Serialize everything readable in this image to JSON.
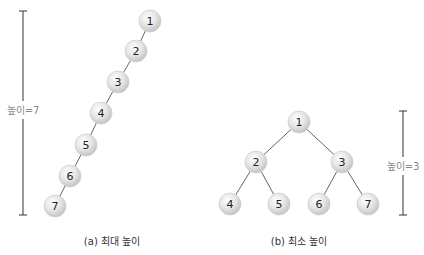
{
  "colors": {
    "node_fill_light": "#f7f7f7",
    "node_fill_dark": "#c9c9c9",
    "node_stroke": "#d0d0d0",
    "edge": "#555555",
    "height_bar": "#333333",
    "height_label": "#8a8a8a"
  },
  "node_radius": 11,
  "trees": [
    {
      "id": "max-height",
      "caption": "(a) 최대 높이",
      "caption_pos": {
        "x": 112,
        "y": 233
      },
      "nodes": [
        {
          "label": "1",
          "x": 150,
          "y": 21
        },
        {
          "label": "2",
          "x": 136,
          "y": 51
        },
        {
          "label": "3",
          "x": 118,
          "y": 82
        },
        {
          "label": "4",
          "x": 101,
          "y": 113
        },
        {
          "label": "5",
          "x": 86,
          "y": 145
        },
        {
          "label": "6",
          "x": 70,
          "y": 176
        },
        {
          "label": "7",
          "x": 55,
          "y": 206
        }
      ],
      "edges": [
        [
          0,
          1
        ],
        [
          1,
          2
        ],
        [
          2,
          3
        ],
        [
          3,
          4
        ],
        [
          4,
          5
        ],
        [
          5,
          6
        ]
      ],
      "height_bar": {
        "x": 23,
        "y1": 11,
        "y2": 215,
        "label": "높이=7",
        "label_y": 110,
        "label_x": 23
      }
    },
    {
      "id": "min-height",
      "caption": "(b) 최소 높이",
      "caption_pos": {
        "x": 299,
        "y": 233
      },
      "nodes": [
        {
          "label": "1",
          "x": 299,
          "y": 122
        },
        {
          "label": "2",
          "x": 256,
          "y": 162
        },
        {
          "label": "3",
          "x": 342,
          "y": 162
        },
        {
          "label": "4",
          "x": 230,
          "y": 204
        },
        {
          "label": "5",
          "x": 279,
          "y": 204
        },
        {
          "label": "6",
          "x": 319,
          "y": 204
        },
        {
          "label": "7",
          "x": 368,
          "y": 204
        }
      ],
      "edges": [
        [
          0,
          1
        ],
        [
          0,
          2
        ],
        [
          1,
          3
        ],
        [
          1,
          4
        ],
        [
          2,
          5
        ],
        [
          2,
          6
        ]
      ],
      "height_bar": {
        "x": 403,
        "y1": 111,
        "y2": 215,
        "label": "높이=3",
        "label_y": 166,
        "label_x": 403
      }
    }
  ]
}
